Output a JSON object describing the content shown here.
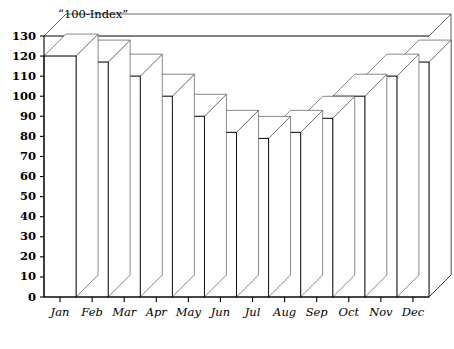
{
  "chart_data": {
    "type": "bar",
    "title": "“100-Index”",
    "xlabel": "",
    "ylabel": "",
    "categories": [
      "Jan",
      "Feb",
      "Mar",
      "Apr",
      "May",
      "Jun",
      "Jul",
      "Aug",
      "Sep",
      "Oct",
      "Nov",
      "Dec"
    ],
    "values": [
      120,
      117,
      110,
      100,
      90,
      82,
      79,
      82,
      89,
      100,
      110,
      117
    ],
    "ylim": [
      0,
      130
    ],
    "ytick_step": 10,
    "yticks": [
      0,
      10,
      20,
      30,
      40,
      50,
      60,
      70,
      80,
      90,
      100,
      110,
      120,
      130
    ],
    "ytick_labels": [
      "0",
      "10",
      "20",
      "30",
      "40",
      "50",
      "60",
      "70",
      "80",
      "90",
      "100",
      "110",
      "120",
      "130"
    ],
    "grid": false,
    "legend": null,
    "style": "3d-perspective-bars",
    "bar_fill_color": "#ffffff",
    "bar_edge_color": "#000000",
    "background_color": "#ffffff",
    "annotations": []
  }
}
